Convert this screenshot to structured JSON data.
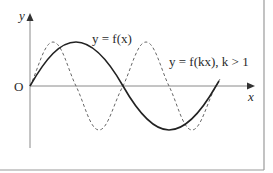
{
  "diagram": {
    "type": "function-graph",
    "axes": {
      "x_label": "x",
      "y_label": "y",
      "origin_label": "O"
    },
    "curves": [
      {
        "name": "f",
        "label": "y = f(x)",
        "style": "solid",
        "color": "#222222"
      },
      {
        "name": "fk",
        "label": "y = f(kx), k > 1",
        "style": "dashed",
        "color": "#555555"
      }
    ],
    "colors": {
      "axis": "#888888",
      "frame": "#999999",
      "background": "#ffffff"
    }
  }
}
